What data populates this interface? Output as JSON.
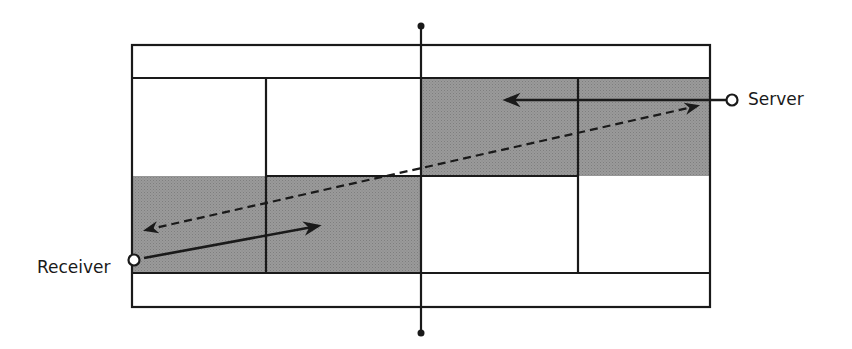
{
  "diagram": {
    "labels": {
      "server": "Server",
      "receiver": "Receiver"
    },
    "colors": {
      "line": "#1a1a1a",
      "shade": "#8f8f8f",
      "background": "#ffffff"
    },
    "court": {
      "outer": {
        "x": 132,
        "y": 45,
        "w": 578,
        "h": 262
      },
      "singles_top_y": 78,
      "singles_bottom_y": 273,
      "center_service_y": 176,
      "net_x": 421,
      "left_service_x": 266,
      "right_service_x": 578
    },
    "shaded_boxes": [
      "left-bottom-service-box (receiver side)",
      "right-top-service-box (server side)"
    ],
    "arrows": [
      {
        "name": "serve-path",
        "style": "dashed",
        "from": "server",
        "to": "receiver"
      },
      {
        "name": "return-path",
        "style": "solid",
        "from": "receiver"
      },
      {
        "name": "server-movement",
        "style": "solid",
        "from": "server"
      }
    ]
  }
}
